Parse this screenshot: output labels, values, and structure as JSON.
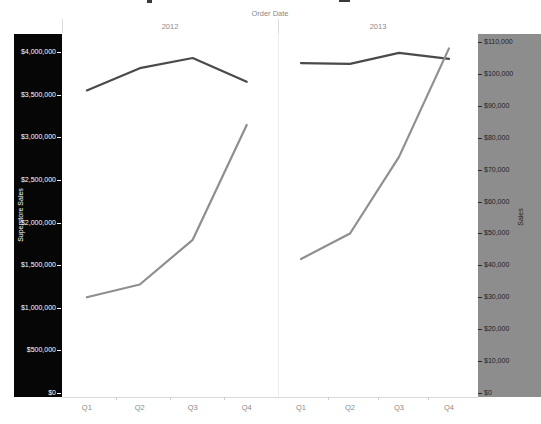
{
  "header": {
    "field_label": "Order Date",
    "panels": [
      "2012",
      "2013"
    ]
  },
  "left_axis": {
    "title": "Superstore Sales",
    "tick_labels": [
      "$4,000,000",
      "$3,500,000",
      "$3,000,000",
      "$2,500,000",
      "$2,000,000",
      "$1,500,000",
      "$1,000,000",
      "$500,000",
      "$0"
    ],
    "band_color": "#060606",
    "text_color": "#ffffff"
  },
  "right_axis": {
    "title": "Sales",
    "tick_labels": [
      "$110,000",
      "$100,000",
      "$90,000",
      "$80,000",
      "$70,000",
      "$60,000",
      "$50,000",
      "$40,000",
      "$30,000",
      "$20,000",
      "$10,000",
      "$0"
    ],
    "band_color": "#8d8d8d",
    "text_color": "#1f1f1f"
  },
  "chart_data": {
    "type": "line",
    "x": {
      "label": "Order Date",
      "categories": [
        "Q1",
        "Q2",
        "Q3",
        "Q4"
      ]
    },
    "left_axis": {
      "label": "Superstore Sales",
      "range": [
        0,
        4000000
      ],
      "tick_step": 500000
    },
    "right_axis": {
      "label": "Sales",
      "range": [
        0,
        110000
      ],
      "tick_step": 10000
    },
    "legend": "none",
    "grid": "off",
    "panels": [
      {
        "label": "2012",
        "series": [
          {
            "name": "Superstore Sales",
            "axis": "left",
            "color": "#4a4a4a",
            "values": [
              3550000,
              3810000,
              3930000,
              3650000
            ]
          },
          {
            "name": "Sales",
            "axis": "right",
            "color": "#8f8f8f",
            "values": [
              30000,
              34000,
              48000,
              84000
            ]
          }
        ]
      },
      {
        "label": "2013",
        "series": [
          {
            "name": "Superstore Sales",
            "axis": "left",
            "color": "#4a4a4a",
            "values": [
              3870000,
              3860000,
              3990000,
              3920000
            ]
          },
          {
            "name": "Sales",
            "axis": "right",
            "color": "#8f8f8f",
            "values": [
              42000,
              50000,
              74000,
              108000
            ]
          }
        ]
      }
    ]
  }
}
